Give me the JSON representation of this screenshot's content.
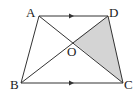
{
  "diagram": {
    "colors": {
      "stroke": "#333333",
      "shade": "#d4d4d4",
      "background": "#ffffff"
    },
    "points": {
      "A": {
        "label": "A",
        "x": 39,
        "y": 16
      },
      "D": {
        "label": "D",
        "x": 108,
        "y": 16
      },
      "B": {
        "label": "B",
        "x": 21,
        "y": 83
      },
      "C": {
        "label": "C",
        "x": 123,
        "y": 83
      },
      "O": {
        "label": "O",
        "x": 73,
        "y": 42
      }
    },
    "segments": [
      "AD",
      "BC",
      "AB",
      "DC",
      "AC",
      "BD"
    ],
    "parallel_marks": [
      "AD",
      "BC"
    ],
    "shaded_region": "triangle OCD"
  }
}
